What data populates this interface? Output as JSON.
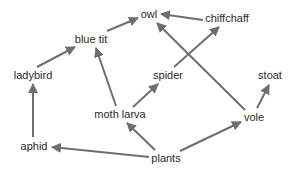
{
  "diagram": {
    "type": "food-web",
    "arrow_color": "#6e6e6e",
    "text_color": "#2a2a2a",
    "nodes": {
      "owl": {
        "label": "owl",
        "x": 149,
        "y": 14
      },
      "chiffchaff": {
        "label": "chiffchaff",
        "x": 227,
        "y": 17
      },
      "blue_tit": {
        "label": "blue tit",
        "x": 91,
        "y": 39
      },
      "ladybird": {
        "label": "ladybird",
        "x": 33,
        "y": 75
      },
      "spider": {
        "label": "spider",
        "x": 168,
        "y": 75
      },
      "stoat": {
        "label": "stoat",
        "x": 270,
        "y": 75
      },
      "moth_larva": {
        "label": "moth larva",
        "x": 120,
        "y": 114
      },
      "vole": {
        "label": "vole",
        "x": 254,
        "y": 117
      },
      "aphid": {
        "label": "aphid",
        "x": 34,
        "y": 145
      },
      "plants": {
        "label": "plants",
        "x": 166,
        "y": 157
      }
    },
    "edges": [
      {
        "from": "blue tit",
        "to": "owl"
      },
      {
        "from": "chiffchaff",
        "to": "owl"
      },
      {
        "from": "vole",
        "to": "owl"
      },
      {
        "from": "ladybird",
        "to": "blue tit"
      },
      {
        "from": "moth larva",
        "to": "blue tit"
      },
      {
        "from": "spider",
        "to": "chiffchaff"
      },
      {
        "from": "moth larva",
        "to": "spider"
      },
      {
        "from": "aphid",
        "to": "ladybird"
      },
      {
        "from": "plants",
        "to": "aphid"
      },
      {
        "from": "plants",
        "to": "moth larva"
      },
      {
        "from": "plants",
        "to": "vole"
      },
      {
        "from": "vole",
        "to": "stoat"
      }
    ]
  }
}
